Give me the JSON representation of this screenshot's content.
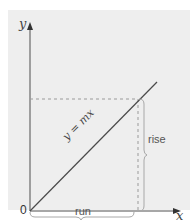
{
  "diagram": {
    "axes": {
      "x_label": "x",
      "y_label": "y",
      "origin_label": "0"
    },
    "line": {
      "equation_label": "y = mx",
      "color": "#4a4a4a"
    },
    "annotations": {
      "rise_label": "rise",
      "run_label": "run"
    },
    "colors": {
      "background": "#ffffff",
      "panel": "#eeeeee",
      "axis": "#8a8a8a",
      "dashed": "#9a9a9a",
      "brace": "#a8a8a8",
      "text": "#555555"
    }
  }
}
